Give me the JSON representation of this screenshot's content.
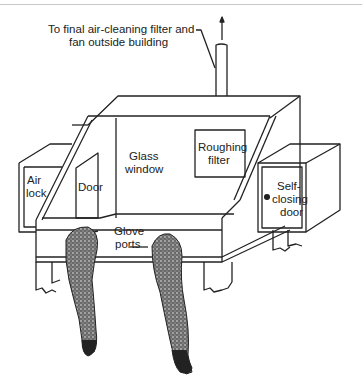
{
  "diagram": {
    "type": "glove box schematic",
    "labels": {
      "exhaust_line1": "To final air-cleaning filter and",
      "exhaust_line2": "fan outside building",
      "airlock_line1": "Air",
      "airlock_line2": "lock",
      "door": "Door",
      "glass_line1": "Glass",
      "glass_line2": "window",
      "roughing_line1": "Roughing",
      "roughing_line2": "filter",
      "selfclosing_line1": "Self-",
      "selfclosing_line2": "closing",
      "selfclosing_line3": "door",
      "glove_line1": "Glove",
      "glove_line2": "ports"
    },
    "colors": {
      "ink": "#222222",
      "glove_fill": "#555555",
      "background": "#ffffff"
    }
  }
}
